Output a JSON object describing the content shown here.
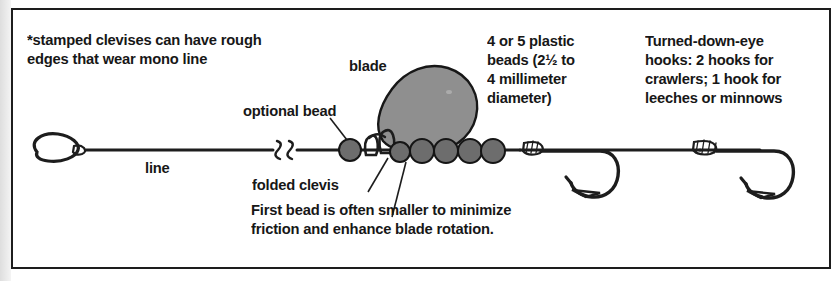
{
  "figure": {
    "background_color": "#ffffff",
    "border_color": "#1d1d1d",
    "ink_color": "#171717",
    "bead_fill": "#6d6d6d",
    "blade_fill": "#8f8f8f"
  },
  "notes": {
    "clevis_warning": "*stamped clevises can have rough\n edges that wear mono line",
    "beads_spec": "4 or 5 plastic\nbeads (2½ to\n4 millimeter\ndiameter)",
    "hooks_spec": "Turned-down-eye\nhooks: 2 hooks for\ncrawlers; 1 hook for\nleeches or minnows",
    "first_bead_caption": "First bead is often smaller to minimize\nfriction and enhance blade rotation."
  },
  "callouts": {
    "blade": "blade",
    "optional_bead": "optional bead",
    "line": "line",
    "folded_clevis": "folded clevis"
  },
  "parts": {
    "beads_count": 6,
    "hooks_count": 2,
    "blade_shape": "teardrop-colorado",
    "line_break_symbol": "double-zigzag"
  }
}
